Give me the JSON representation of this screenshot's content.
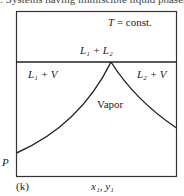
{
  "caption": ": Systems having immiscible liquid phases",
  "diagram": {
    "condition": "T = const.",
    "regions": {
      "top": "L₁ + L₂",
      "left": "L₁ + V",
      "right": "L₂ + V",
      "center": "Vapor"
    },
    "y_axis_label": "P",
    "x_axis_label": "x₁, y₁",
    "panel_label": "(k)"
  }
}
